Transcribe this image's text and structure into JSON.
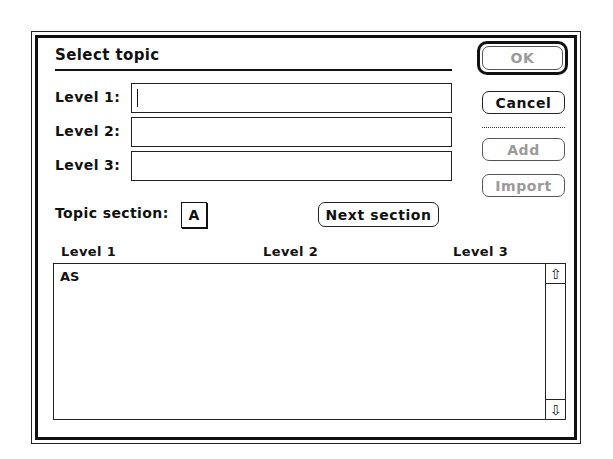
{
  "dialog": {
    "title": "Select topic",
    "fields": [
      {
        "label": "Level 1:",
        "value": ""
      },
      {
        "label": "Level 2:",
        "value": ""
      },
      {
        "label": "Level 3:",
        "value": ""
      }
    ],
    "buttons": {
      "ok": "OK",
      "cancel": "Cancel",
      "add": "Add",
      "import": "Import",
      "next_section": "Next section"
    },
    "topic_section": {
      "label": "Topic section:",
      "value": "A"
    },
    "list": {
      "columns": [
        "Level 1",
        "Level 2",
        "Level 3"
      ],
      "rows": [
        {
          "level1": "AS",
          "level2": "",
          "level3": ""
        }
      ],
      "scroll_up_icon": "⇧",
      "scroll_down_icon": "⇩"
    }
  }
}
